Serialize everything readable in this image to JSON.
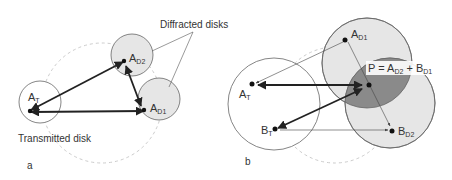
{
  "panel_a": {
    "label": "a",
    "transmitted_label": "Transmitted disk",
    "diffracted_label": "Diffracted disks",
    "points": {
      "AT": {
        "main": "A",
        "sub": "T"
      },
      "AD2": {
        "main": "A",
        "sub": "D2"
      },
      "AD1": {
        "main": "A",
        "sub": "D1"
      }
    }
  },
  "panel_b": {
    "label": "b",
    "points": {
      "AT": {
        "main": "A",
        "sub": "T"
      },
      "BT": {
        "main": "B",
        "sub": "T"
      },
      "AD1": {
        "main": "A",
        "sub": "D1"
      },
      "BD2": {
        "main": "B",
        "sub": "D2"
      }
    },
    "equation": {
      "prefix": "P = A",
      "sub1": "D2",
      "mid": " + B",
      "sub2": "D1"
    }
  },
  "colors": {
    "disk_fill": "#e6e6e6",
    "overlap_fill": "#8a8a8a",
    "stroke": "#555555",
    "arrow": "#222222",
    "dashed": "#c8c8c8"
  }
}
